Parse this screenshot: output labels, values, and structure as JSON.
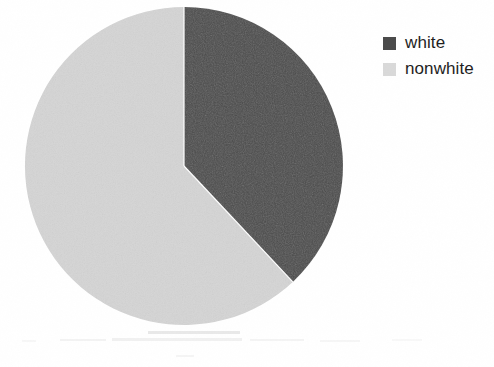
{
  "chart_data": {
    "type": "pie",
    "title": "",
    "categories": [
      "white",
      "nonwhite"
    ],
    "values": [
      38,
      62
    ],
    "units": "percent",
    "colors": [
      "#4a4a4a",
      "#d5d5d5"
    ],
    "start_angle_deg": 0,
    "direction": "clockwise",
    "legend_position": "right",
    "grid": false,
    "labels_shown": false,
    "slices": [
      {
        "label": "white",
        "value": 38,
        "color": "#4a4a4a",
        "sweep_deg": 137
      },
      {
        "label": "nonwhite",
        "value": 62,
        "color": "#d5d5d5",
        "sweep_deg": 223
      }
    ]
  },
  "legend": {
    "items": [
      {
        "label": "white",
        "swatch_color": "#4a4a4a",
        "swatch_name": "legend-swatch-white"
      },
      {
        "label": "nonwhite",
        "swatch_color": "#d9d9d9",
        "swatch_name": "legend-swatch-nonwhite"
      }
    ]
  },
  "pie": {
    "center_x": 184,
    "center_y": 166,
    "radius": 159,
    "outline_color": "#ffffff",
    "background": "#ffffff"
  }
}
